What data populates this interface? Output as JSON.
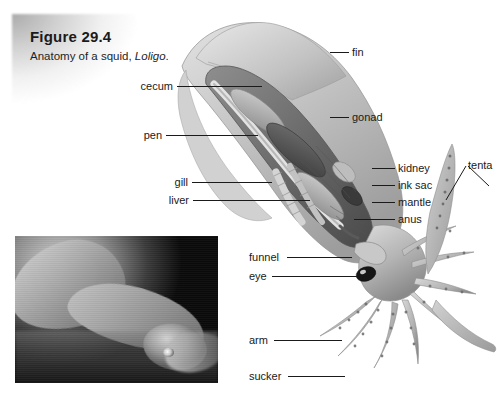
{
  "figure": {
    "title": "Figure 29.4",
    "caption_prefix": "Anatomy of a squid, ",
    "caption_species": "Loligo",
    "caption_suffix": "."
  },
  "labels": {
    "left": [
      {
        "name": "cecum",
        "text": "cecum",
        "x": 136,
        "y": 81,
        "line_from": 177,
        "line_to": 262,
        "line_y": 86
      },
      {
        "name": "pen",
        "text": "pen",
        "x": 140,
        "y": 130,
        "line_from": 166,
        "line_to": 258,
        "line_y": 135
      },
      {
        "name": "gill",
        "text": "gill",
        "x": 172,
        "y": 177,
        "line_from": 192,
        "line_to": 272,
        "line_y": 182
      },
      {
        "name": "liver",
        "text": "liver",
        "x": 166,
        "y": 195,
        "line_from": 193,
        "line_to": 310,
        "line_y": 200
      }
    ],
    "right": [
      {
        "name": "fin",
        "text": "fin",
        "x": 352,
        "y": 47,
        "line_from": 330,
        "line_to": 349,
        "line_y": 52
      },
      {
        "name": "gonad",
        "text": "gonad",
        "x": 352,
        "y": 112,
        "line_from": 330,
        "line_to": 349,
        "line_y": 117
      },
      {
        "name": "kidney",
        "text": "kidney",
        "x": 398,
        "y": 163,
        "line_from": 372,
        "line_to": 395,
        "line_y": 168
      },
      {
        "name": "ink-sac",
        "text": "ink sac",
        "x": 398,
        "y": 180,
        "line_from": 372,
        "line_to": 395,
        "line_y": 185
      },
      {
        "name": "mantle",
        "text": "mantle",
        "x": 398,
        "y": 197,
        "line_from": 372,
        "line_to": 395,
        "line_y": 202
      },
      {
        "name": "anus",
        "text": "anus",
        "x": 398,
        "y": 214,
        "line_from": 354,
        "line_to": 395,
        "line_y": 219
      },
      {
        "name": "tentacles",
        "text": "tenta",
        "x": 468,
        "y": 160
      }
    ],
    "lower": [
      {
        "name": "funnel",
        "text": "funnel",
        "x": 249,
        "y": 252,
        "line_from": 287,
        "line_to": 352,
        "line_y": 257
      },
      {
        "name": "eye",
        "text": "eye",
        "x": 249,
        "y": 271,
        "line_from": 272,
        "line_to": 357,
        "line_y": 276
      },
      {
        "name": "arm",
        "text": "arm",
        "x": 249,
        "y": 335,
        "line_from": 274,
        "line_to": 342,
        "line_y": 340
      },
      {
        "name": "sucker",
        "text": "sucker",
        "x": 249,
        "y": 371,
        "line_from": 288,
        "line_to": 345,
        "line_y": 376
      }
    ]
  },
  "colors": {
    "ink": "#1a1a1a",
    "page": "#ffffff",
    "photo_background": "#000000",
    "body_light": "#d6d6d6",
    "body_mid": "#a9a9a9",
    "body_dark": "#6d6d6d",
    "organ_dark": "#4a4a4a"
  },
  "photo_inset": {
    "name": "squid-photograph",
    "description": "black-and-white underwater photograph of a live squid"
  }
}
